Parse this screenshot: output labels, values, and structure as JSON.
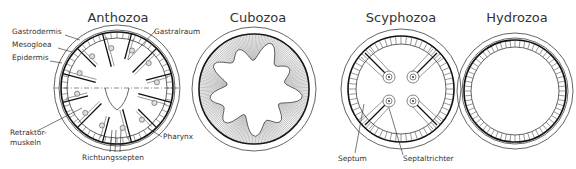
{
  "figure": {
    "panels": [
      {
        "title": "Anthozoa",
        "labels": {
          "gastrodermis": "Gastrodermis",
          "mesogloea": "Mesogloea",
          "epidermis": "Epidermis",
          "gastralraum": "Gastralraum",
          "retraktor_1": "Retraktor-",
          "retraktor_2": "muskeln",
          "pharynx": "Pharynx",
          "richtungssepten": "Richtungssepten"
        }
      },
      {
        "title": "Cubozoa",
        "labels": {}
      },
      {
        "title": "Scyphozoa",
        "labels": {
          "septum": "Septum",
          "septaltrichter": "Septaltrichter"
        }
      },
      {
        "title": "Hydrozoa",
        "labels": {}
      }
    ],
    "colors": {
      "line": "#222222",
      "text": "#333333",
      "background": "#ffffff"
    }
  }
}
